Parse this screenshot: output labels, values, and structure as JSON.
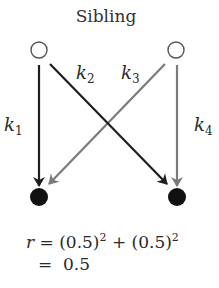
{
  "title": "Sibling",
  "colors": {
    "black_arrow": "#1e1e1e",
    "gray_arrow": "#7a7a7a",
    "parent_node_stroke": "#555555",
    "child_node_fill": "#111111"
  },
  "nodes": {
    "parents": [
      {
        "id": "parent-left",
        "type": "open-circle",
        "cx": 39,
        "cy": 50
      },
      {
        "id": "parent-right",
        "type": "open-circle",
        "cx": 176,
        "cy": 50
      }
    ],
    "children": [
      {
        "id": "child-left",
        "type": "filled-circle",
        "cx": 39,
        "cy": 197
      },
      {
        "id": "child-right",
        "type": "filled-circle",
        "cx": 177,
        "cy": 197
      }
    ]
  },
  "edges": [
    {
      "id": "k1",
      "label": "k",
      "subscript": "1",
      "from": "parent-left",
      "to": "child-left",
      "color": "black"
    },
    {
      "id": "k2",
      "label": "k",
      "subscript": "2",
      "from": "parent-left",
      "to": "child-right",
      "color": "black"
    },
    {
      "id": "k3",
      "label": "k",
      "subscript": "3",
      "from": "parent-right",
      "to": "child-left",
      "color": "gray"
    },
    {
      "id": "k4",
      "label": "k",
      "subscript": "4",
      "from": "parent-right",
      "to": "child-right",
      "color": "gray"
    }
  ],
  "formula": {
    "line1": {
      "var": "r",
      "eq": " = (0.5)",
      "sup1": "2",
      "plus": " + (0.5)",
      "sup2": "2"
    },
    "line2": {
      "eq": "=  0.5"
    }
  }
}
